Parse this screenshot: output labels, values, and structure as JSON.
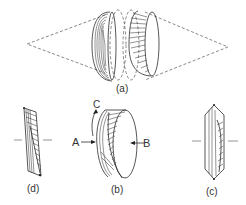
{
  "figure": {
    "panels": [
      {
        "id": "a",
        "label": "(a)",
        "description": "Two lens elements between converging and diverging dashed ray cones"
      },
      {
        "id": "b",
        "label": "(b)",
        "description": "Tilted disk with hatched face and arrows"
      },
      {
        "id": "c",
        "label": "(c)",
        "description": "Edge-on parallelogram section with hatching"
      },
      {
        "id": "d",
        "label": "(d)",
        "description": "Edge-on hexagonal section with hatching"
      }
    ],
    "annotations": {
      "arrow_a": "A",
      "arrow_b": "B",
      "rotation_c": "C"
    },
    "colors": {
      "ink": "#2b2b2b",
      "background": "#ffffff",
      "dashed": "#555555"
    }
  }
}
